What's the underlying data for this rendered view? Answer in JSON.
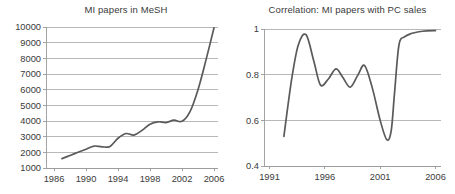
{
  "figure": {
    "background_color": "#ffffff",
    "line_color": "#5a5a5a",
    "grid_color": "#a6a6a6",
    "axis_color": "#9a9a9a"
  },
  "chart_data": [
    {
      "type": "line",
      "id": "mi-papers-in-mesh",
      "title": "MI papers in MeSH",
      "xlabel": "",
      "ylabel": "",
      "grid": "horizontal",
      "legend": "none",
      "xlim": [
        1985,
        2006.5
      ],
      "ylim": [
        1000,
        10000
      ],
      "xticks": [
        1986,
        1990,
        1994,
        1998,
        2002,
        2006
      ],
      "xtick_labels": [
        "1986",
        "1990",
        "1994",
        "1998",
        "2002",
        "2006"
      ],
      "yticks": [
        1000,
        2000,
        3000,
        4000,
        5000,
        6000,
        7000,
        8000,
        9000,
        10000
      ],
      "ytick_labels": [
        "1000",
        "2000",
        "3000",
        "4000",
        "5000",
        "6000",
        "7000",
        "8000",
        "9000",
        "10000"
      ],
      "x": [
        1987,
        1988,
        1989,
        1990,
        1991,
        1992,
        1993,
        1994,
        1995,
        1996,
        1997,
        1998,
        1999,
        2000,
        2001,
        2002,
        2003,
        2004,
        2005,
        2006
      ],
      "values": [
        1600,
        1800,
        2000,
        2200,
        2400,
        2350,
        2380,
        2900,
        3200,
        3100,
        3400,
        3800,
        3950,
        3900,
        4050,
        3980,
        4600,
        6000,
        7900,
        9950
      ]
    },
    {
      "type": "line",
      "id": "correlation-mi-papers-pc-sales",
      "title": "Correlation: MI papers with PC sales",
      "xlabel": "",
      "ylabel": "",
      "grid": "horizontal",
      "legend": "none",
      "xlim": [
        1990.5,
        2006.5
      ],
      "ylim": [
        0.4,
        1.0
      ],
      "xticks": [
        1991,
        1996,
        2001,
        2006
      ],
      "xtick_labels": [
        "1991",
        "1996",
        "2001",
        "2006"
      ],
      "yticks": [
        0.4,
        0.6,
        0.8,
        1.0
      ],
      "ytick_labels": [
        "0.4",
        "0.6",
        "0.8",
        "1"
      ],
      "x": [
        1992.3,
        1993.0,
        1993.6,
        1994.3,
        1995.0,
        1995.6,
        1996.3,
        1997.0,
        1997.6,
        1998.3,
        1999.0,
        1999.6,
        2000.3,
        2001.0,
        2001.6,
        2002.0,
        2002.3,
        2002.7,
        2003.2,
        2003.8,
        2004.5,
        2005.2,
        2006.0
      ],
      "values": [
        0.53,
        0.78,
        0.93,
        0.975,
        0.86,
        0.755,
        0.78,
        0.825,
        0.79,
        0.745,
        0.8,
        0.84,
        0.74,
        0.6,
        0.515,
        0.555,
        0.72,
        0.93,
        0.965,
        0.98,
        0.988,
        0.992,
        0.993
      ]
    }
  ]
}
